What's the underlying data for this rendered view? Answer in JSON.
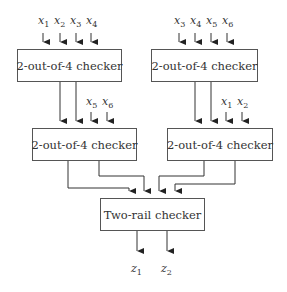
{
  "diagram": {
    "boxes": {
      "top_left": {
        "label": "2-out-of-4 checker"
      },
      "top_right": {
        "label": "2-out-of-4 checker"
      },
      "mid_left": {
        "label": "2-out-of-4 checker"
      },
      "mid_right": {
        "label": "2-out-of-4 checker"
      },
      "two_rail": {
        "label": "Two-rail checker"
      }
    },
    "inputs": {
      "top_left": [
        {
          "var": "x",
          "sub": "1"
        },
        {
          "var": "x",
          "sub": "2"
        },
        {
          "var": "x",
          "sub": "3"
        },
        {
          "var": "x",
          "sub": "4"
        }
      ],
      "top_right": [
        {
          "var": "x",
          "sub": "3"
        },
        {
          "var": "x",
          "sub": "4"
        },
        {
          "var": "x",
          "sub": "5"
        },
        {
          "var": "x",
          "sub": "6"
        }
      ],
      "mid_left": [
        {
          "var": "x",
          "sub": "5"
        },
        {
          "var": "x",
          "sub": "6"
        }
      ],
      "mid_right": [
        {
          "var": "x",
          "sub": "1"
        },
        {
          "var": "x",
          "sub": "2"
        }
      ]
    },
    "outputs": [
      {
        "var": "z",
        "sub": "1"
      },
      {
        "var": "z",
        "sub": "2"
      }
    ]
  }
}
